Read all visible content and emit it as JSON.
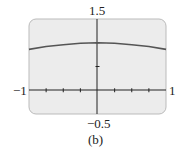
{
  "chart_data": {
    "type": "line",
    "title": "",
    "caption": "(b)",
    "xlabel": "",
    "ylabel": "",
    "xlim": [
      -1,
      1
    ],
    "ylim": [
      -0.5,
      1.5
    ],
    "x_tick_step": 0.25,
    "y_tick_step": 0.5,
    "axis_labels": {
      "xmin": "−1",
      "xmax": "1",
      "ymax": "1.5",
      "ymin": "−0.5"
    },
    "grid": false,
    "series": [
      {
        "name": "f(x)",
        "x": [
          -1,
          -0.75,
          -0.5,
          -0.25,
          0,
          0.25,
          0.5,
          0.75,
          1
        ],
        "y": [
          0.86,
          0.92,
          0.96,
          0.99,
          1.0,
          0.99,
          0.96,
          0.92,
          0.86
        ]
      }
    ],
    "colors": {
      "background": "#ececec",
      "curve": "#555555",
      "axis": "#222222"
    }
  }
}
